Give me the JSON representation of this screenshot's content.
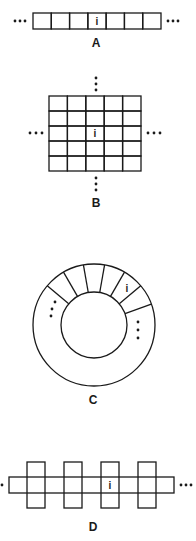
{
  "figure": {
    "background": "#ffffff",
    "ink_color": "#1a1a1a",
    "panels": [
      {
        "id": "A",
        "label": "A",
        "kind": "linear-array",
        "cells": 7,
        "marked_cell_index": 3,
        "marked_text": "i",
        "continuation": "horizontal ellipsis on both ends"
      },
      {
        "id": "B",
        "label": "B",
        "kind": "2d-grid",
        "rows": 5,
        "cols": 5,
        "marked_cell": {
          "row": 2,
          "col": 2
        },
        "marked_text": "i",
        "continuation": "ellipsis on all four sides"
      },
      {
        "id": "C",
        "label": "C",
        "kind": "ring",
        "visible_segments": 6,
        "marked_segment_index": 4,
        "marked_text": "i",
        "continuation": "vertical ellipsis inside ring on both sides"
      },
      {
        "id": "D",
        "label": "D",
        "kind": "linear-array-with-crossing-cells",
        "vertical_cells": 4,
        "marked_cell_index": 2,
        "marked_text": "i",
        "continuation": "horizontal ellipsis on both ends"
      }
    ]
  }
}
